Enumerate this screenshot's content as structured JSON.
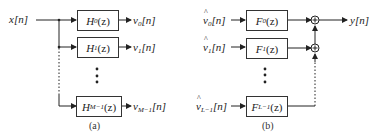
{
  "panel_a": {
    "input": "x[n]",
    "filters": [
      {
        "name": "H",
        "sub": "0",
        "arg": "(z)",
        "out_name": "v",
        "out_sub": "0",
        "out_arg": "[n]"
      },
      {
        "name": "H",
        "sub": "1",
        "arg": "(z)",
        "out_name": "v",
        "out_sub": "1",
        "out_arg": "[n]"
      },
      {
        "name": "H",
        "sub": "M−1",
        "arg": "(z)",
        "out_name": "v",
        "out_sub": "M−1",
        "out_arg": "[n]"
      }
    ],
    "caption": "(a)"
  },
  "panel_b": {
    "inputs": [
      {
        "name": "v",
        "sub": "0",
        "arg": "[n]"
      },
      {
        "name": "v",
        "sub": "1",
        "arg": "[n]"
      },
      {
        "name": "v",
        "sub": "L−1",
        "arg": "[n]"
      }
    ],
    "filters": [
      {
        "name": "F",
        "sub": "0",
        "arg": "(z)"
      },
      {
        "name": "F",
        "sub": "1",
        "arg": "(z)"
      },
      {
        "name": "F",
        "sub": "L−1",
        "arg": "(z)"
      }
    ],
    "output": "y[n]",
    "adder_symbol": "+",
    "caption": "(b)"
  }
}
